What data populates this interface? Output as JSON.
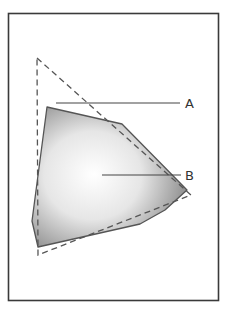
{
  "diagram": {
    "frame": {
      "x": 8.5,
      "y": 13.5,
      "width": 210,
      "height": 287,
      "stroke": "#3a3a3a"
    },
    "shaded_region": {
      "points": [
        [
          47,
          107
        ],
        [
          122,
          124
        ],
        [
          187,
          190
        ],
        [
          165,
          210
        ],
        [
          140,
          224
        ],
        [
          38,
          247
        ],
        [
          32,
          221
        ]
      ],
      "stroke": "#555555",
      "gradient": {
        "center": "#ffffff",
        "mid": "#e6e6e6",
        "edge": "#7a7a7a"
      }
    },
    "dashed_triangle": {
      "points": [
        [
          37,
          58
        ],
        [
          191,
          195
        ],
        [
          38,
          255
        ]
      ],
      "stroke": "#555555",
      "dash": "6,4"
    },
    "labels": [
      {
        "id": "A",
        "text": "A",
        "line": [
          [
            56,
            103
          ],
          [
            180,
            103
          ]
        ],
        "text_x": 185,
        "text_y": 108
      },
      {
        "id": "B",
        "text": "B",
        "line": [
          [
            102,
            175
          ],
          [
            181,
            175
          ]
        ],
        "text_x": 185,
        "text_y": 180
      }
    ]
  }
}
